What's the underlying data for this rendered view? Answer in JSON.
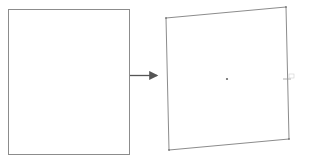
{
  "diagram": {
    "colors": {
      "stroke": "#8c8c8c",
      "arrow": "#555555",
      "point": "#666666",
      "background": "#ffffff"
    },
    "source_shape": {
      "type": "rectangle",
      "x": 8,
      "y": 9,
      "width": 121,
      "height": 145
    },
    "arrow": {
      "from": [
        130,
        75
      ],
      "to": [
        159,
        75
      ]
    },
    "target_shape": {
      "type": "quadrilateral",
      "points": [
        [
          166,
          18
        ],
        [
          286,
          7
        ],
        [
          289,
          139
        ],
        [
          169,
          150
        ]
      ]
    },
    "center_point": [
      227,
      79
    ],
    "edge_marker": {
      "position": [
        287,
        78
      ],
      "label": ""
    },
    "caption": ""
  }
}
